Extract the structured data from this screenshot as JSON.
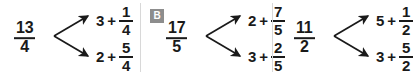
{
  "background_color": "#ffffff",
  "text_color": "#1a1a1a",
  "divider_color": "#d8d8d8",
  "badge": {
    "label": "B",
    "background_color": "#8d8d8d",
    "text_color": "#ffffff"
  },
  "diagrams": [
    {
      "id": "diagram-a",
      "source": {
        "numerator": "13",
        "denominator": "4"
      },
      "branches": [
        {
          "whole": "3",
          "plus": "+",
          "numerator": "1",
          "denominator": "4"
        },
        {
          "whole": "2",
          "plus": "+",
          "numerator": "5",
          "denominator": "4"
        }
      ]
    },
    {
      "id": "diagram-b",
      "badge_label": "B",
      "source": {
        "numerator": "17",
        "denominator": "5"
      },
      "branches": [
        {
          "whole": "2",
          "plus": "+",
          "numerator": "7",
          "denominator": "5"
        },
        {
          "whole": "3",
          "plus": "+",
          "numerator": "2",
          "denominator": "5"
        }
      ]
    },
    {
      "id": "diagram-c",
      "source": {
        "numerator": "11",
        "denominator": "2"
      },
      "branches": [
        {
          "whole": "5",
          "plus": "+",
          "numerator": "1",
          "denominator": "2"
        },
        {
          "whole": "3",
          "plus": "+",
          "numerator": "5",
          "denominator": "2"
        }
      ]
    }
  ]
}
